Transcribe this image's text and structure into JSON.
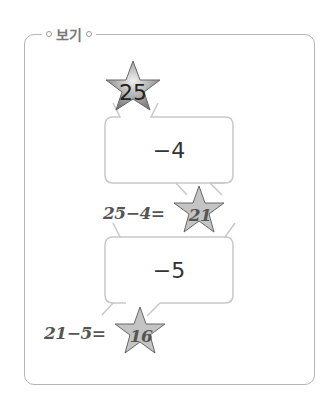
{
  "legend": {
    "title": "보기"
  },
  "start": {
    "value": "25"
  },
  "steps": [
    {
      "operation": "−4",
      "equation": "25−4=",
      "result": "21"
    },
    {
      "operation": "−5",
      "equation": "21−5=",
      "result": "16"
    }
  ],
  "colors": {
    "border": "#b5b5b5",
    "star_start": "#8a8a8a",
    "star_result": "#c4c4c4",
    "handwriting": "#555555"
  }
}
